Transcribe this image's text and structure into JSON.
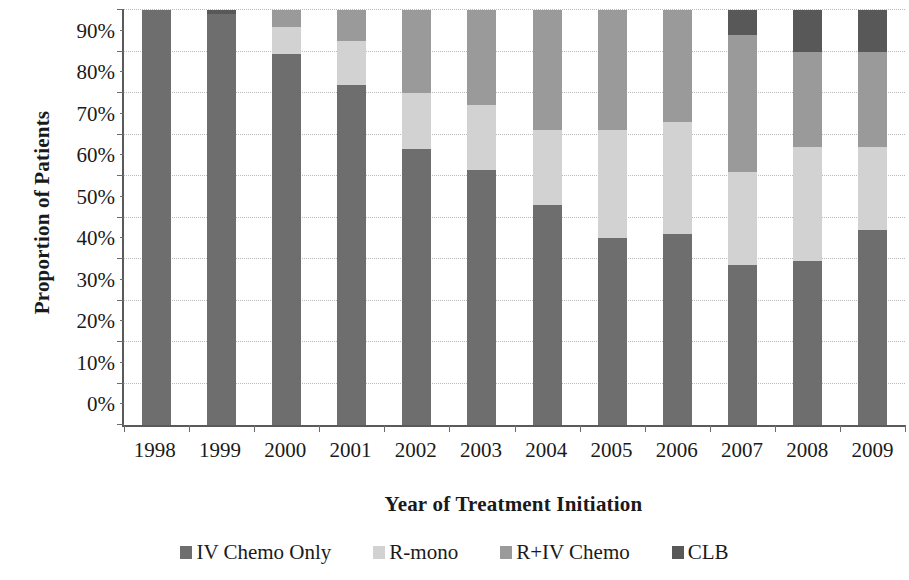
{
  "chart_data": {
    "type": "bar",
    "stacked": true,
    "stack_mode": "percent",
    "title": "",
    "xlabel": "Year of Treatment Initiation",
    "ylabel": "Proportion of Patients",
    "ylim": [
      0,
      100
    ],
    "ytick_labels": [
      "0%",
      "10%",
      "20%",
      "30%",
      "40%",
      "50%",
      "60%",
      "70%",
      "80%",
      "90%",
      "100%"
    ],
    "ytick_values": [
      0,
      10,
      20,
      30,
      40,
      50,
      60,
      70,
      80,
      90,
      100
    ],
    "grid": true,
    "grid_axis": "y",
    "legend_position": "bottom",
    "categories": [
      "1998",
      "1999",
      "2000",
      "2001",
      "2002",
      "2003",
      "2004",
      "2005",
      "2006",
      "2007",
      "2008",
      "2009"
    ],
    "series": [
      {
        "name": "IV Chemo Only",
        "color": "#6e6e6e",
        "values": [
          100,
          99,
          89.5,
          82,
          66.5,
          61.5,
          53,
          45,
          46,
          38.5,
          39.5,
          47
        ]
      },
      {
        "name": "R-mono",
        "color": "#d2d2d2",
        "values": [
          0,
          0,
          6.5,
          10.5,
          13.5,
          15.5,
          18,
          26,
          27,
          22.5,
          27.5,
          20
        ]
      },
      {
        "name": "R+IV Chemo",
        "color": "#9a9a9a",
        "values": [
          0,
          0,
          4,
          7.5,
          20,
          23,
          29,
          29,
          27,
          33,
          23,
          23
        ]
      },
      {
        "name": "CLB",
        "color": "#585858",
        "values": [
          0,
          1,
          0,
          0,
          0,
          0,
          0,
          0,
          0,
          6,
          10,
          10
        ]
      }
    ]
  },
  "axis": {
    "y_title": "Proportion of Patients",
    "x_title": "Year of Treatment Initiation"
  }
}
